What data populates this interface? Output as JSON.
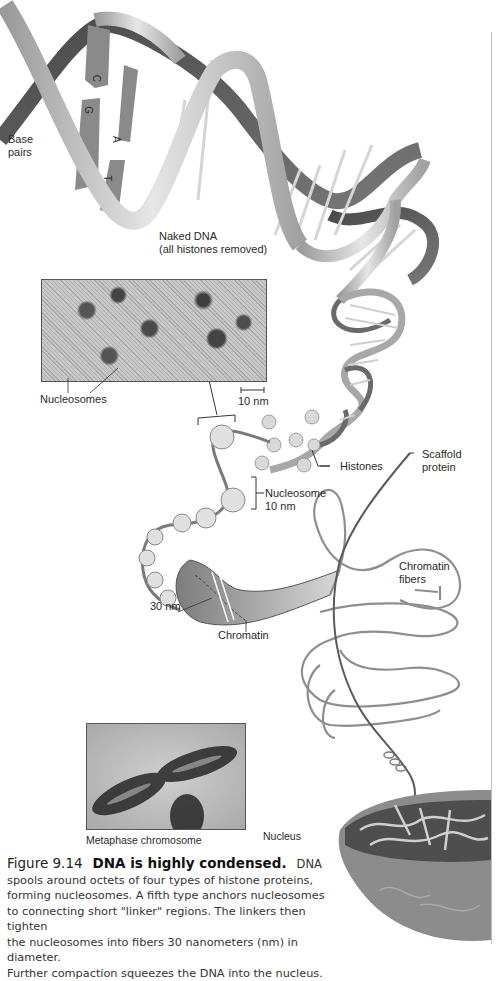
{
  "figure": {
    "number": "Figure 9.14",
    "headline": "DNA is highly condensed.",
    "caption_lead": "DNA",
    "caption_lines": [
      "spools around octets of four types of histone proteins,",
      "forming nucleosomes. A fifth type anchors nucleosomes",
      "to connecting short \"linker\" regions. The linkers then tighten",
      "the nucleosomes into fibers 30 nanometers (nm) in diameter.",
      "Further compaction squeezes the DNA into the nucleus."
    ]
  },
  "labels": {
    "base_pairs": [
      "Base",
      "pairs"
    ],
    "base_letters": [
      "C",
      "G",
      "A",
      "T"
    ],
    "naked_dna": [
      "Naked DNA",
      "(all histones removed)"
    ],
    "nucleosomes": "Nucleosomes",
    "scale_bar": "10 nm",
    "histones": "Histones",
    "scaffold_protein": [
      "Scaffold",
      "protein"
    ],
    "nucleosome_size": [
      "Nucleosome",
      "10 nm"
    ],
    "chromatin_fibers": [
      "Chromatin",
      "fibers"
    ],
    "fiber_size": "30 nm",
    "chromatin": "Chromatin",
    "metaphase_chromosome": "Metaphase chromosome",
    "nucleus": "Nucleus"
  },
  "colors": {
    "ribbon_light": "#cfcfcf",
    "ribbon_dark": "#5a5a5a",
    "rung": "#d8d8d8",
    "text": "#2a2a2a"
  }
}
